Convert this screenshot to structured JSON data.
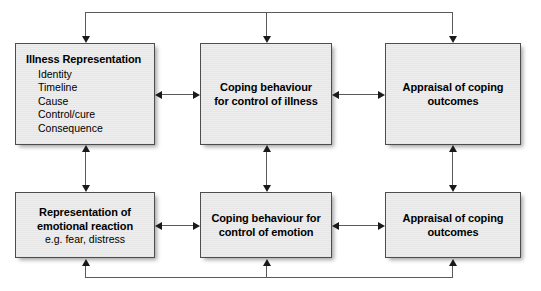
{
  "diagram": {
    "colors": {
      "box_fill": "#e9e9e9",
      "box_border": "#4d4d4d",
      "connector": "#5a5a5a",
      "arrowhead": "#1a1a1a",
      "background": "#ffffff",
      "text": "#000000"
    },
    "boxes": [
      {
        "id": "illness-representation",
        "title": "Illness Representation",
        "items": [
          "Identity",
          "Timeline",
          "Cause",
          "Control/cure",
          "Consequence"
        ]
      },
      {
        "id": "coping-behaviour-illness",
        "line1": "Coping behaviour",
        "line2": "for control of illness"
      },
      {
        "id": "appraisal-coping-outcomes-top",
        "line1": "Appraisal of coping",
        "line2": "outcomes"
      },
      {
        "id": "representation-emotional-reaction",
        "line1": "Representation of",
        "line2": "emotional reaction",
        "sub": "e.g. fear, distress"
      },
      {
        "id": "coping-behaviour-emotion",
        "line1": "Coping behaviour for",
        "line2": "control of emotion"
      },
      {
        "id": "appraisal-coping-outcomes-bottom",
        "line1": "Appraisal of coping",
        "line2": "outcomes"
      }
    ],
    "connectors": [
      {
        "id": "illness-rep-to-coping-illness",
        "kind": "bidirectional-horizontal"
      },
      {
        "id": "coping-illness-to-appraisal-top",
        "kind": "bidirectional-horizontal"
      },
      {
        "id": "emotional-rep-to-coping-emotion",
        "kind": "bidirectional-horizontal"
      },
      {
        "id": "coping-emotion-to-appraisal-bottom",
        "kind": "bidirectional-horizontal"
      },
      {
        "id": "illness-rep-to-emotional-rep",
        "kind": "bidirectional-vertical"
      },
      {
        "id": "coping-illness-to-coping-emotion",
        "kind": "bidirectional-vertical"
      },
      {
        "id": "appraisal-top-to-appraisal-bottom",
        "kind": "bidirectional-vertical"
      },
      {
        "id": "top-feedback-bus",
        "kind": "feedback-bus-down"
      },
      {
        "id": "bottom-feedback-bus",
        "kind": "feedback-bus-up"
      }
    ]
  }
}
